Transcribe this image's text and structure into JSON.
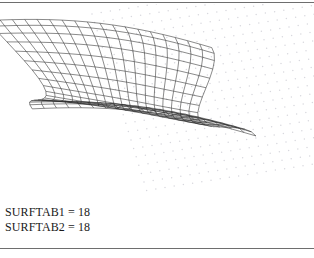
{
  "figure": {
    "background_color": "#ffffff",
    "rule_color": "#6e6e6e",
    "mesh_color": "#2b2b2b",
    "grid_dot_color": "#d8d8de"
  },
  "caption": {
    "line1": "SURFTAB1 = 18",
    "line2": "SURFTAB2 = 18"
  },
  "chart_data": {
    "type": "surface-wireframe",
    "surftab1": 18,
    "surftab2": 18,
    "u_divisions": 18,
    "v_divisions": 18,
    "surface_form": "two-lobe folded ruled surface (AutoCAD RULESURF/EDGESURF style)",
    "mesh_line_color": "#2b2b2b",
    "mesh_line_width": 0.55,
    "grid": {
      "visible": true,
      "type": "snap-dot-grid",
      "dot_color": "#d8d8de",
      "dot_radius": 0.75,
      "columns": 26,
      "rows": 22,
      "spacing_x": 9.2,
      "spacing_y": 8.4,
      "origin_x": 92,
      "origin_y": 10,
      "shear_x": 2.6,
      "shear_y": -1.45
    },
    "view": {
      "projection": "isometric-oblique",
      "rotation_deg": -22,
      "axis_labels_shown": false,
      "legend": false
    },
    "surface_params": {
      "amplitude": 30,
      "phase_shift": 3.141592653589793,
      "depth_scale": 0.62,
      "width": 188,
      "height": 96,
      "origin_x": 28,
      "origin_y": 74
    }
  }
}
